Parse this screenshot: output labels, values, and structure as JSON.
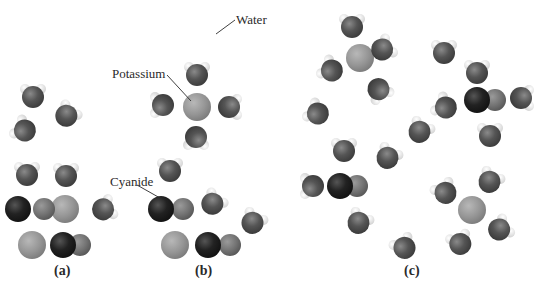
{
  "colors": {
    "oxygen": "#5a5a5a",
    "hydrogen": "#f4f4f4",
    "potassium": "#9a9a9a",
    "carbon": "#1e1e1e",
    "nitrogen": "#7a7a7a",
    "label": "#2a2a2a"
  },
  "labels": {
    "water": "Water",
    "potassium": "Potassium",
    "cyanide": "Cyanide"
  },
  "panels": [
    {
      "id": "a",
      "caption": "(a)",
      "description": "Solid KCN crystal surface next to water molecules",
      "waters": [
        [
          33,
          96,
          0
        ],
        [
          67,
          115,
          40
        ],
        [
          24,
          130,
          -60
        ],
        [
          27,
          174,
          0
        ],
        [
          66,
          175,
          0
        ],
        [
          104,
          209,
          70
        ]
      ],
      "potassium": [
        [
          65,
          209
        ],
        [
          32,
          245
        ]
      ],
      "cyanide": [
        [
          18,
          209,
          44,
          209
        ],
        [
          63,
          245,
          80,
          245
        ]
      ]
    },
    {
      "id": "b",
      "caption": "(b)",
      "description": "Ions leaving the crystal, surrounded by water",
      "waters": [
        [
          197,
          74,
          0
        ],
        [
          162,
          105,
          -90
        ],
        [
          230,
          107,
          90
        ],
        [
          196,
          138,
          180
        ],
        [
          170,
          170,
          0
        ],
        [
          213,
          203,
          40
        ],
        [
          253,
          222,
          30
        ]
      ],
      "potassium": [
        [
          197,
          107
        ],
        [
          175,
          245
        ]
      ],
      "cyanide": [
        [
          161,
          209,
          183,
          209
        ],
        [
          208,
          245,
          230,
          245
        ]
      ]
    },
    {
      "id": "c",
      "caption": "(c)",
      "description": "Fully hydrated potassium and cyanide ions dispersed in water",
      "waters": [
        [
          352,
          26,
          0
        ],
        [
          331,
          70,
          -60
        ],
        [
          383,
          49,
          60
        ],
        [
          379,
          90,
          150
        ],
        [
          317,
          113,
          -60
        ],
        [
          444,
          52,
          0
        ],
        [
          477,
          72,
          0
        ],
        [
          445,
          107,
          -60
        ],
        [
          522,
          98,
          90
        ],
        [
          490,
          135,
          0
        ],
        [
          420,
          131,
          30
        ],
        [
          344,
          150,
          0
        ],
        [
          388,
          157,
          30
        ],
        [
          312,
          186,
          -90
        ],
        [
          359,
          222,
          30
        ],
        [
          445,
          192,
          -30
        ],
        [
          490,
          181,
          30
        ],
        [
          500,
          229,
          60
        ],
        [
          460,
          243,
          -20
        ],
        [
          404,
          247,
          -30
        ]
      ],
      "potassium": [
        [
          360,
          58
        ],
        [
          472,
          210
        ]
      ],
      "cyanide": [
        [
          340,
          186,
          357,
          186
        ],
        [
          477,
          100,
          495,
          100
        ]
      ]
    }
  ],
  "annotations": [
    {
      "text_key": "water",
      "x": 236,
      "y": 12,
      "line": [
        [
          235,
          20
        ],
        [
          216,
          34
        ]
      ]
    },
    {
      "text_key": "potassium",
      "x": 112,
      "y": 66,
      "line": [
        [
          167,
          75
        ],
        [
          191,
          101
        ]
      ]
    },
    {
      "text_key": "cyanide",
      "x": 110,
      "y": 174,
      "line": [
        [
          137,
          185
        ],
        [
          160,
          198
        ]
      ]
    }
  ],
  "captions": [
    {
      "text": "(a)",
      "x": 54,
      "y": 277
    },
    {
      "text": "(b)",
      "x": 195,
      "y": 277
    },
    {
      "text": "(c)",
      "x": 404,
      "y": 277
    }
  ]
}
